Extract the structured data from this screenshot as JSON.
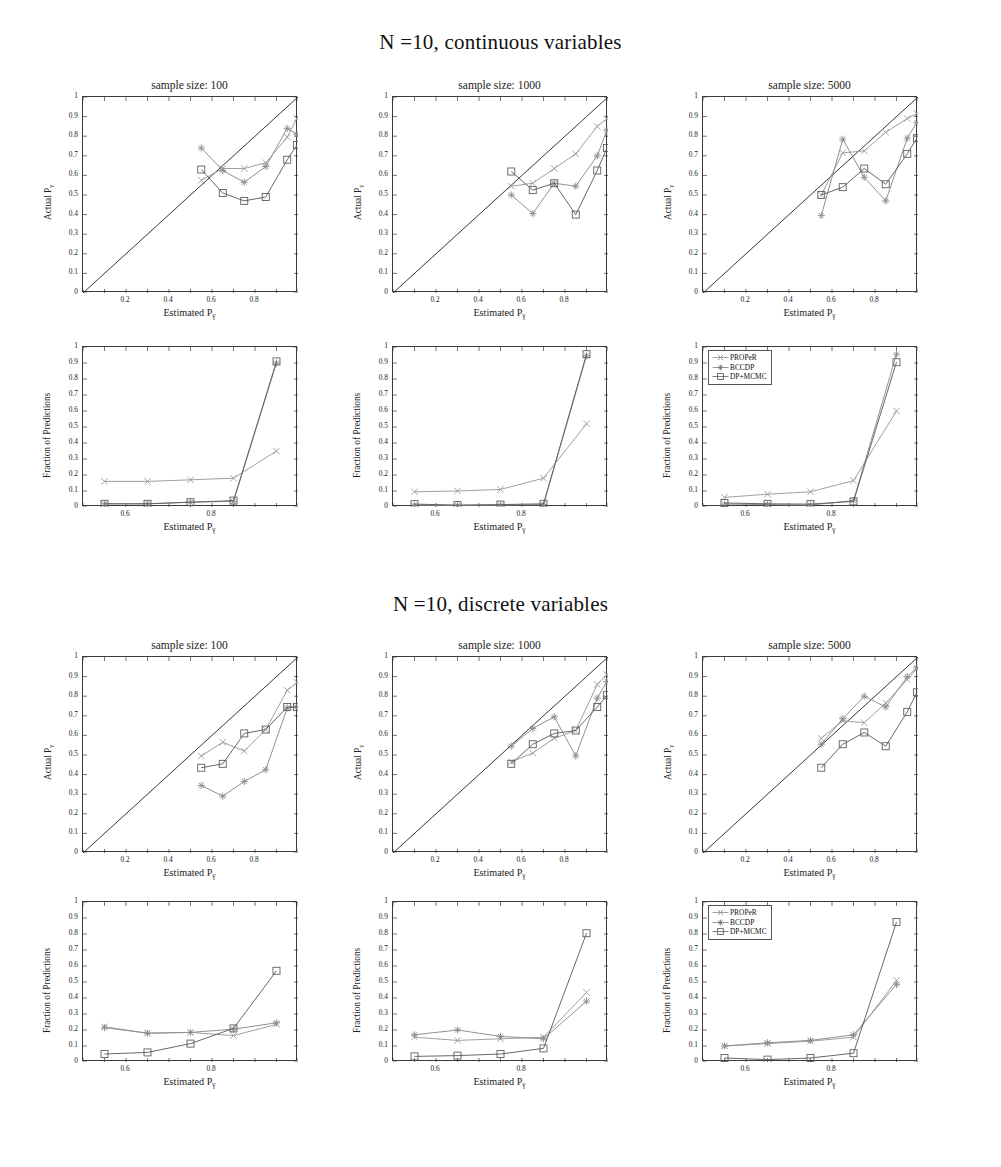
{
  "figure": {
    "width": 1001,
    "height": 1167,
    "sections": [
      {
        "title": "N =10, continuous variables"
      },
      {
        "title": "N =10, discrete variables"
      }
    ],
    "panel_titles": [
      "sample size: 100",
      "sample size: 1000",
      "sample size: 5000"
    ],
    "axis_labels": {
      "calibration_y": "Actual P",
      "fraction_y": "Fraction of Predictions",
      "x": "Estimated P",
      "subscript": "γ"
    },
    "legend": {
      "entries": [
        {
          "label": "PROPeR",
          "marker": "x",
          "color": "#8a8a8a"
        },
        {
          "label": "BCCDP",
          "marker": "star",
          "color": "#7c7c7c"
        },
        {
          "label": "DP+MCMC",
          "marker": "square",
          "color": "#606060"
        }
      ]
    },
    "colors": {
      "proper": "#9a9a9a",
      "bccdp": "#8b8b8b",
      "dpmcmc": "#5f5f5f",
      "diagonal": "#2b2b2b",
      "axis": "#3a3a3a"
    },
    "ticks": {
      "calibration_y": [
        "0",
        "0.1",
        "0.2",
        "0.3",
        "0.4",
        "0.5",
        "0.6",
        "0.7",
        "0.8",
        "0.9",
        "1"
      ],
      "calibration_x": [
        "0.2",
        "0.4",
        "0.6",
        "0.8"
      ],
      "fraction_y": [
        "0",
        "0.1",
        "0.2",
        "0.3",
        "0.4",
        "0.5",
        "0.6",
        "0.7",
        "0.8",
        "0.9",
        "1"
      ],
      "fraction_x": [
        "0.6",
        "0.8"
      ]
    }
  },
  "chart_data": [
    {
      "id": "cont-100-calibration",
      "type": "line",
      "title": "sample size: 100",
      "section": "N =10, continuous variables",
      "xlabel": "Estimated Pγ",
      "ylabel": "Actual Pγ",
      "xlim": [
        0,
        1
      ],
      "ylim": [
        0,
        1
      ],
      "grid": false,
      "reference_line": {
        "from": [
          0,
          0
        ],
        "to": [
          1,
          1
        ]
      },
      "x": [
        0.55,
        0.65,
        0.75,
        0.85,
        0.95,
        0.995
      ],
      "series": [
        {
          "name": "PROPeR",
          "values": [
            0.575,
            0.635,
            0.635,
            0.665,
            0.795,
            0.89
          ]
        },
        {
          "name": "BCCDP",
          "values": [
            0.74,
            0.625,
            0.565,
            0.645,
            0.84,
            0.81
          ]
        },
        {
          "name": "DP+MCMC",
          "values": [
            0.63,
            0.51,
            0.47,
            0.49,
            0.68,
            0.755
          ]
        }
      ]
    },
    {
      "id": "cont-1000-calibration",
      "type": "line",
      "title": "sample size: 1000",
      "section": "N =10, continuous variables",
      "xlabel": "Estimated Pγ",
      "ylabel": "Actual Pγ",
      "xlim": [
        0,
        1
      ],
      "ylim": [
        0,
        1
      ],
      "grid": false,
      "reference_line": {
        "from": [
          0,
          0
        ],
        "to": [
          1,
          1
        ]
      },
      "x": [
        0.55,
        0.65,
        0.75,
        0.85,
        0.95,
        0.995
      ],
      "series": [
        {
          "name": "PROPeR",
          "values": [
            0.545,
            0.56,
            0.635,
            0.71,
            0.85,
            0.89
          ]
        },
        {
          "name": "BCCDP",
          "values": [
            0.5,
            0.405,
            0.56,
            0.545,
            0.7,
            0.83
          ]
        },
        {
          "name": "DP+MCMC",
          "values": [
            0.62,
            0.525,
            0.56,
            0.4,
            0.625,
            0.74
          ]
        }
      ]
    },
    {
      "id": "cont-5000-calibration",
      "type": "line",
      "title": "sample size: 5000",
      "section": "N =10, continuous variables",
      "xlabel": "Estimated Pγ",
      "ylabel": "Actual Pγ",
      "xlim": [
        0,
        1
      ],
      "ylim": [
        0,
        1
      ],
      "grid": false,
      "reference_line": {
        "from": [
          0,
          0
        ],
        "to": [
          1,
          1
        ]
      },
      "x": [
        0.55,
        0.65,
        0.75,
        0.85,
        0.95,
        0.995
      ],
      "series": [
        {
          "name": "PROPeR",
          "values": [
            0.5,
            0.715,
            0.725,
            0.82,
            0.89,
            0.915
          ]
        },
        {
          "name": "BCCDP",
          "values": [
            0.395,
            0.785,
            0.59,
            0.47,
            0.79,
            0.87
          ]
        },
        {
          "name": "DP+MCMC",
          "values": [
            0.5,
            0.54,
            0.635,
            0.555,
            0.71,
            0.79
          ]
        }
      ]
    },
    {
      "id": "cont-100-fraction",
      "type": "line",
      "title": "",
      "section": "N =10, continuous variables",
      "xlabel": "Estimated Pγ",
      "ylabel": "Fraction of Predictions",
      "xlim": [
        0.5,
        1
      ],
      "ylim": [
        0,
        1
      ],
      "grid": false,
      "x": [
        0.55,
        0.65,
        0.75,
        0.85,
        0.95
      ],
      "series": [
        {
          "name": "PROPeR",
          "values": [
            0.16,
            0.16,
            0.17,
            0.18,
            0.35
          ]
        },
        {
          "name": "BCCDP",
          "values": [
            0.02,
            0.02,
            0.03,
            0.035,
            0.9
          ]
        },
        {
          "name": "DP+MCMC",
          "values": [
            0.02,
            0.02,
            0.03,
            0.04,
            0.91
          ]
        }
      ]
    },
    {
      "id": "cont-1000-fraction",
      "type": "line",
      "title": "",
      "section": "N =10, continuous variables",
      "xlabel": "Estimated Pγ",
      "ylabel": "Fraction of Predictions",
      "xlim": [
        0.5,
        1
      ],
      "ylim": [
        0,
        1
      ],
      "grid": false,
      "x": [
        0.55,
        0.65,
        0.75,
        0.85,
        0.95
      ],
      "series": [
        {
          "name": "PROPeR",
          "values": [
            0.095,
            0.1,
            0.11,
            0.18,
            0.52
          ]
        },
        {
          "name": "BCCDP",
          "values": [
            0.012,
            0.01,
            0.012,
            0.015,
            0.945
          ]
        },
        {
          "name": "DP+MCMC",
          "values": [
            0.018,
            0.012,
            0.015,
            0.02,
            0.955
          ]
        }
      ]
    },
    {
      "id": "cont-5000-fraction",
      "type": "line",
      "title": "",
      "section": "N =10, continuous variables",
      "xlabel": "Estimated Pγ",
      "ylabel": "Fraction of Predictions",
      "xlim": [
        0.5,
        1
      ],
      "ylim": [
        0,
        1
      ],
      "grid": false,
      "legend": true,
      "x": [
        0.55,
        0.65,
        0.75,
        0.85,
        0.95
      ],
      "series": [
        {
          "name": "PROPeR",
          "values": [
            0.06,
            0.08,
            0.095,
            0.165,
            0.6
          ]
        },
        {
          "name": "BCCDP",
          "values": [
            0.018,
            0.015,
            0.012,
            0.04,
            0.955
          ]
        },
        {
          "name": "DP+MCMC",
          "values": [
            0.025,
            0.02,
            0.018,
            0.035,
            0.905
          ]
        }
      ]
    },
    {
      "id": "disc-100-calibration",
      "type": "line",
      "title": "sample size: 100",
      "section": "N =10, discrete variables",
      "xlabel": "Estimated Pγ",
      "ylabel": "Actual Pγ",
      "xlim": [
        0,
        1
      ],
      "ylim": [
        0,
        1
      ],
      "grid": false,
      "reference_line": {
        "from": [
          0,
          0
        ],
        "to": [
          1,
          1
        ]
      },
      "x": [
        0.55,
        0.65,
        0.75,
        0.85,
        0.95,
        0.995
      ],
      "series": [
        {
          "name": "PROPeR",
          "values": [
            0.495,
            0.565,
            0.52,
            0.63,
            0.83,
            0.87
          ]
        },
        {
          "name": "BCCDP",
          "values": [
            0.345,
            0.29,
            0.365,
            0.425,
            0.74,
            0.745
          ]
        },
        {
          "name": "DP+MCMC",
          "values": [
            0.435,
            0.455,
            0.61,
            0.63,
            0.745,
            0.745
          ]
        }
      ]
    },
    {
      "id": "disc-1000-calibration",
      "type": "line",
      "title": "sample size: 1000",
      "section": "N =10, discrete variables",
      "xlabel": "Estimated Pγ",
      "ylabel": "Actual Pγ",
      "xlim": [
        0,
        1
      ],
      "ylim": [
        0,
        1
      ],
      "grid": false,
      "reference_line": {
        "from": [
          0,
          0
        ],
        "to": [
          1,
          1
        ]
      },
      "x": [
        0.55,
        0.65,
        0.75,
        0.85,
        0.95,
        0.995
      ],
      "series": [
        {
          "name": "PROPeR",
          "values": [
            0.465,
            0.51,
            0.585,
            0.625,
            0.86,
            0.91
          ]
        },
        {
          "name": "BCCDP",
          "values": [
            0.545,
            0.635,
            0.695,
            0.495,
            0.79,
            0.875
          ]
        },
        {
          "name": "DP+MCMC",
          "values": [
            0.455,
            0.555,
            0.61,
            0.625,
            0.745,
            0.805
          ]
        }
      ]
    },
    {
      "id": "disc-5000-calibration",
      "type": "line",
      "title": "sample size: 5000",
      "section": "N =10, discrete variables",
      "xlabel": "Estimated Pγ",
      "ylabel": "Actual Pγ",
      "xlim": [
        0,
        1
      ],
      "ylim": [
        0,
        1
      ],
      "grid": false,
      "reference_line": {
        "from": [
          0,
          0
        ],
        "to": [
          1,
          1
        ]
      },
      "x": [
        0.55,
        0.65,
        0.75,
        0.85,
        0.95,
        0.995
      ],
      "series": [
        {
          "name": "PROPeR",
          "values": [
            0.585,
            0.675,
            0.665,
            0.765,
            0.885,
            0.94
          ]
        },
        {
          "name": "BCCDP",
          "values": [
            0.555,
            0.685,
            0.8,
            0.745,
            0.9,
            0.945
          ]
        },
        {
          "name": "DP+MCMC",
          "values": [
            0.435,
            0.555,
            0.615,
            0.545,
            0.72,
            0.82
          ]
        }
      ]
    },
    {
      "id": "disc-100-fraction",
      "type": "line",
      "title": "",
      "section": "N =10, discrete variables",
      "xlabel": "Estimated Pγ",
      "ylabel": "Fraction of Predictions",
      "xlim": [
        0.5,
        1
      ],
      "ylim": [
        0,
        1
      ],
      "grid": false,
      "x": [
        0.55,
        0.65,
        0.75,
        0.85,
        0.95
      ],
      "series": [
        {
          "name": "PROPeR",
          "values": [
            0.22,
            0.18,
            0.185,
            0.165,
            0.235
          ]
        },
        {
          "name": "BCCDP",
          "values": [
            0.215,
            0.18,
            0.185,
            0.205,
            0.245
          ]
        },
        {
          "name": "DP+MCMC",
          "values": [
            0.05,
            0.06,
            0.115,
            0.21,
            0.57
          ]
        }
      ]
    },
    {
      "id": "disc-1000-fraction",
      "type": "line",
      "title": "",
      "section": "N =10, discrete variables",
      "xlabel": "Estimated Pγ",
      "ylabel": "Fraction of Predictions",
      "xlim": [
        0.5,
        1
      ],
      "ylim": [
        0,
        1
      ],
      "grid": false,
      "x": [
        0.55,
        0.65,
        0.75,
        0.85,
        0.95
      ],
      "series": [
        {
          "name": "PROPeR",
          "values": [
            0.155,
            0.135,
            0.145,
            0.155,
            0.435
          ]
        },
        {
          "name": "BCCDP",
          "values": [
            0.17,
            0.2,
            0.16,
            0.145,
            0.38
          ]
        },
        {
          "name": "DP+MCMC",
          "values": [
            0.035,
            0.04,
            0.05,
            0.085,
            0.805
          ]
        }
      ]
    },
    {
      "id": "disc-5000-fraction",
      "type": "line",
      "title": "",
      "section": "N =10, discrete variables",
      "xlabel": "Estimated Pγ",
      "ylabel": "Fraction of Predictions",
      "xlim": [
        0.5,
        1
      ],
      "ylim": [
        0,
        1
      ],
      "grid": false,
      "legend": true,
      "x": [
        0.55,
        0.65,
        0.75,
        0.85,
        0.95
      ],
      "series": [
        {
          "name": "PROPeR",
          "values": [
            0.1,
            0.115,
            0.13,
            0.155,
            0.51
          ]
        },
        {
          "name": "BCCDP",
          "values": [
            0.1,
            0.12,
            0.135,
            0.17,
            0.485
          ]
        },
        {
          "name": "DP+MCMC",
          "values": [
            0.025,
            0.015,
            0.025,
            0.055,
            0.875
          ]
        }
      ]
    }
  ]
}
